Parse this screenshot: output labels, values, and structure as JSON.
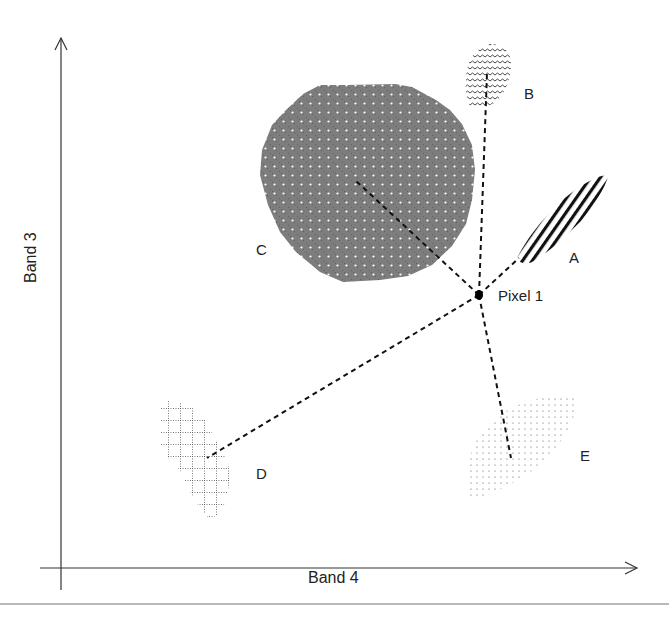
{
  "diagram": {
    "type": "feature-space-minimum-distance",
    "axes": {
      "x_label": "Band 4",
      "y_label": "Band 3"
    },
    "pixel": {
      "label": "Pixel 1",
      "x": 479,
      "y": 295
    },
    "classes": [
      {
        "label": "A",
        "pattern": "diagonal-stripes",
        "centroid": [
          519,
          258
        ],
        "label_pos": [
          569,
          256
        ]
      },
      {
        "label": "B",
        "pattern": "wavy-lines",
        "centroid": [
          487,
          73
        ],
        "label_pos": [
          524,
          92
        ]
      },
      {
        "label": "C",
        "pattern": "dotted-gray",
        "centroid": [
          357,
          180
        ],
        "label_pos": [
          256,
          248
        ]
      },
      {
        "label": "D",
        "pattern": "dotted-grid",
        "centroid": [
          207,
          458
        ],
        "label_pos": [
          256,
          472
        ]
      },
      {
        "label": "E",
        "pattern": "sparse-dots",
        "centroid": [
          511,
          458
        ],
        "label_pos": [
          580,
          454
        ]
      }
    ],
    "colors": {
      "axis": "#333333",
      "cluster_c_fill": "#7a7a7a",
      "line": "#111111",
      "text": "#222222"
    }
  }
}
